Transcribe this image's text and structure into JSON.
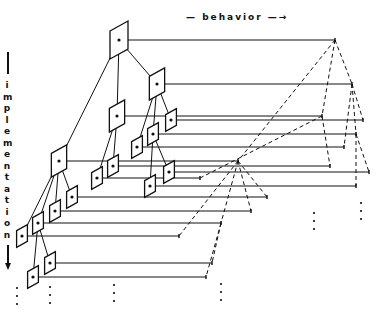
{
  "labels": {
    "behavior": "— behavior —→",
    "implementation": "implementation"
  },
  "colors": {
    "ink": "#111111",
    "background": "#ffffff"
  },
  "nodes": [
    {
      "id": "n0",
      "x": 119,
      "y": 40,
      "s": 1.0,
      "end": 335
    },
    {
      "id": "n1",
      "x": 157,
      "y": 84,
      "s": 0.85,
      "end": 352
    },
    {
      "id": "n2",
      "x": 117,
      "y": 116,
      "s": 0.85,
      "end": 322
    },
    {
      "id": "n3",
      "x": 171,
      "y": 120,
      "s": 0.6,
      "end": 363
    },
    {
      "id": "n4",
      "x": 153,
      "y": 134,
      "s": 0.6,
      "end": 356
    },
    {
      "id": "n5",
      "x": 137,
      "y": 147,
      "s": 0.6,
      "end": 344
    },
    {
      "id": "n6",
      "x": 59,
      "y": 161,
      "s": 0.85,
      "end": 238
    },
    {
      "id": "n7",
      "x": 113,
      "y": 166,
      "s": 0.6,
      "end": 330
    },
    {
      "id": "n8",
      "x": 169,
      "y": 172,
      "s": 0.6,
      "end": 369
    },
    {
      "id": "n9",
      "x": 97,
      "y": 178,
      "s": 0.6,
      "end": 200
    },
    {
      "id": "n10",
      "x": 150,
      "y": 186,
      "s": 0.6,
      "end": 356
    },
    {
      "id": "n11",
      "x": 72,
      "y": 197,
      "s": 0.6,
      "end": 267
    },
    {
      "id": "n12",
      "x": 55,
      "y": 211,
      "s": 0.6,
      "end": 251
    },
    {
      "id": "n13",
      "x": 38,
      "y": 223,
      "s": 0.6,
      "end": 221
    },
    {
      "id": "n14",
      "x": 22,
      "y": 236,
      "s": 0.6,
      "end": 179
    },
    {
      "id": "n15",
      "x": 50,
      "y": 263,
      "s": 0.6,
      "end": 212
    },
    {
      "id": "n16",
      "x": 33,
      "y": 277,
      "s": 0.6,
      "end": 206
    }
  ],
  "tree_edges": [
    [
      "n0",
      "n1"
    ],
    [
      "n0",
      "n2"
    ],
    [
      "n0",
      "n6"
    ],
    [
      "n1",
      "n3"
    ],
    [
      "n1",
      "n4"
    ],
    [
      "n1",
      "n5"
    ],
    [
      "n2",
      "n9"
    ],
    [
      "n2",
      "n7"
    ],
    [
      "n4",
      "n8"
    ],
    [
      "n4",
      "n10"
    ],
    [
      "n6",
      "n11"
    ],
    [
      "n6",
      "n12"
    ],
    [
      "n6",
      "n13"
    ],
    [
      "n6",
      "n14"
    ],
    [
      "n13",
      "n15"
    ],
    [
      "n13",
      "n16"
    ]
  ],
  "dashed_edges": [
    [
      "n0",
      "n1"
    ],
    [
      "n0",
      "n2"
    ],
    [
      "n0",
      "n6"
    ],
    [
      "n1",
      "n3"
    ],
    [
      "n1",
      "n4"
    ],
    [
      "n1",
      "n5"
    ],
    [
      "n2",
      "n9"
    ],
    [
      "n2",
      "n7"
    ],
    [
      "n4",
      "n8"
    ],
    [
      "n4",
      "n10"
    ],
    [
      "n6",
      "n11"
    ],
    [
      "n6",
      "n12"
    ],
    [
      "n6",
      "n13"
    ],
    [
      "n6",
      "n14"
    ],
    [
      "n13",
      "n15"
    ],
    [
      "n13",
      "n16"
    ]
  ],
  "continuation_dots": [
    {
      "x": 17,
      "y": 288
    },
    {
      "x": 50,
      "y": 287
    },
    {
      "x": 114,
      "y": 285
    },
    {
      "x": 221,
      "y": 284
    },
    {
      "x": 314,
      "y": 213
    },
    {
      "x": 361,
      "y": 203
    }
  ]
}
